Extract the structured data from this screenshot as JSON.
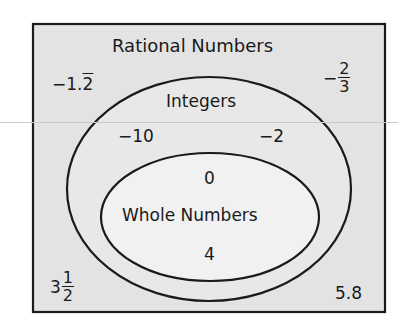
{
  "diagram": {
    "type": "venn-nested",
    "colors": {
      "outer_fill": "#e3e3e3",
      "integers_fill": "#e8e8e8",
      "whole_fill": "#f1f1f1",
      "stroke": "#1a1a1a"
    },
    "sets": {
      "rational": {
        "label": "Rational Numbers",
        "members": [
          {
            "sign": "−",
            "text": "1.",
            "repeat": "2"
          },
          {
            "sign": "−",
            "numerator": "2",
            "denominator": "3"
          },
          {
            "whole": "3",
            "numerator": "1",
            "denominator": "2"
          },
          {
            "text": "5.8"
          }
        ]
      },
      "integers": {
        "label": "Integers",
        "members": [
          "−10",
          "−2"
        ]
      },
      "whole": {
        "label": "Whole Numbers",
        "members": [
          "0",
          "4"
        ]
      }
    }
  }
}
